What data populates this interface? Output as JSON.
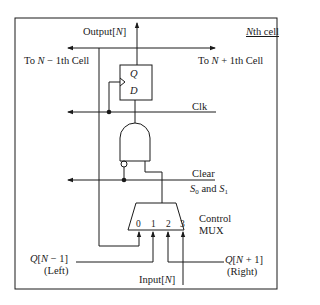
{
  "diagram": {
    "type": "logic-circuit",
    "title": "Nth cell",
    "labels": {
      "cell_title": "Nth cell",
      "output": "Output[N]",
      "to_prev": "To N − 1th Cell",
      "to_next": "To N + 1th Cell",
      "ff_q": "Q",
      "ff_d": "D",
      "clk": "Clk",
      "clear": "Clear",
      "select": "S0 and S1",
      "mux_label_1": "Control",
      "mux_label_2": "MUX",
      "mux_inputs": [
        "0",
        "1",
        "2",
        "3"
      ],
      "left_input_1": "Q[N − 1]",
      "left_input_2": "(Left)",
      "right_input_1": "Q[N + 1]",
      "right_input_2": "(Right)",
      "input_n": "Input[N]"
    },
    "components": [
      {
        "id": "d-flip-flop",
        "pins": [
          "D",
          "Q",
          "Clk"
        ]
      },
      {
        "id": "and-gate",
        "inputs": [
          "Clear (inverted)",
          "MUX output"
        ],
        "output": "D"
      },
      {
        "id": "control-mux",
        "inputs": [
          "0: Q[N] feedback",
          "1: Q[N-1] (Left)",
          "2: Q[N+1] (Right)",
          "3: Input[N]"
        ],
        "select": "S0 and S1"
      }
    ],
    "colors": {
      "line": "#1a1a1a",
      "background": "#ffffff"
    }
  }
}
